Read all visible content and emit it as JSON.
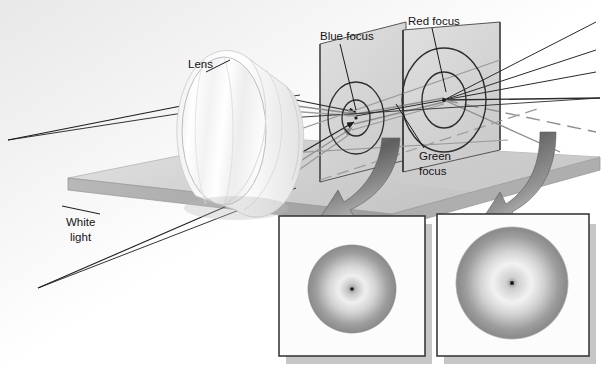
{
  "figure": {
    "title_visible": false,
    "background_color": "#ffffff"
  },
  "labels": {
    "lens": "Lens",
    "white_light_line1": "White",
    "white_light_line2": "light",
    "blue_focus": "Blue focus",
    "red_focus": "Red focus",
    "green_focus_line1": "Green",
    "green_focus_line2": "focus"
  },
  "colors": {
    "base_top": "#d2d2d2",
    "base_edge": "#a8a8a8",
    "screen_fill": "#d7d7d7",
    "screen_stroke": "#4a4a4a",
    "ray_dark": "#1a1a1a",
    "ray_mid": "#8c8c8c",
    "arrow_dark": "#6e6e6e",
    "arrow_light": "#c6c6c6",
    "inset_frame": "#3a3a3a",
    "inset_fill": "#fdfdfd",
    "shadow": "#b4b4b4",
    "spot_outer": "#9a9a9a",
    "spot_inner": "#f2f2f2",
    "text": "#141414"
  },
  "elements": {
    "lens_name": "biconvex-lens",
    "base_name": "optical-bench-slab",
    "screen_a_name": "blue-focus-screen",
    "screen_b_name": "red-focus-screen",
    "inset_left_name": "blue-focus-spot-inset",
    "inset_right_name": "red-focus-spot-inset",
    "arrow_left_name": "callout-arrow-left",
    "arrow_right_name": "callout-arrow-right"
  },
  "insets": {
    "left": {
      "caption": "",
      "spot_type": "blurred-disc-with-center-dot"
    },
    "right": {
      "caption": "",
      "spot_type": "blurred-disc-with-center-dot"
    }
  }
}
